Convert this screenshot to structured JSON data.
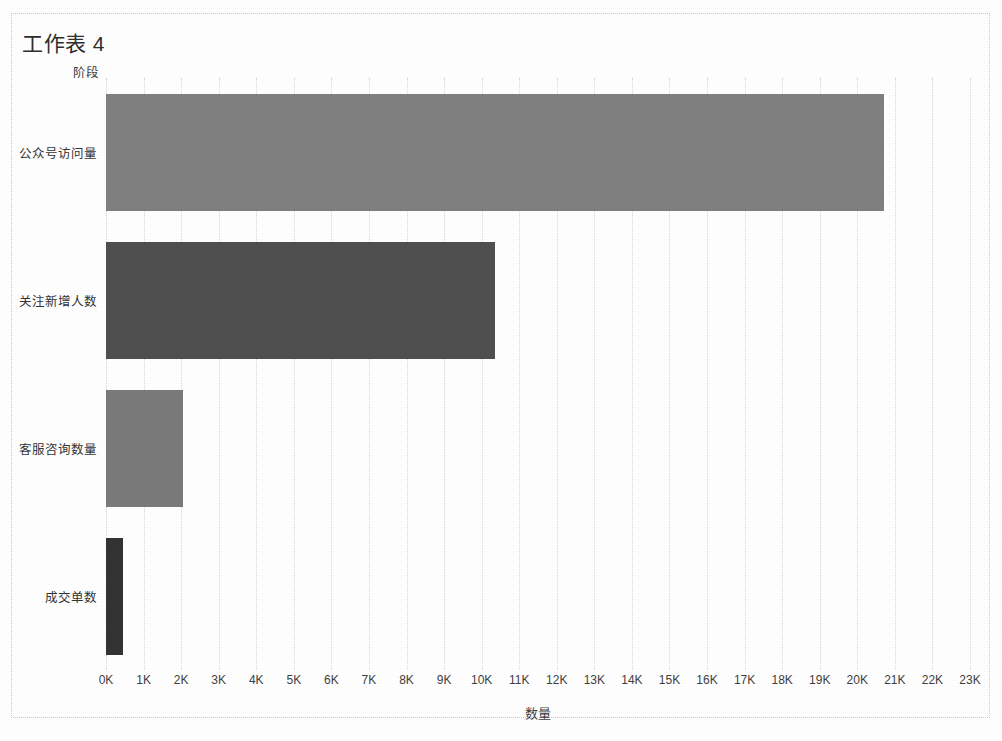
{
  "chart_title": "工作表 4",
  "axis_titles": {
    "y": "阶段",
    "x": "数量"
  },
  "ticks": {
    "x": [
      "0K",
      "1K",
      "2K",
      "3K",
      "4K",
      "5K",
      "6K",
      "7K",
      "8K",
      "9K",
      "10K",
      "11K",
      "12K",
      "13K",
      "14K",
      "15K",
      "16K",
      "17K",
      "18K",
      "19K",
      "20K",
      "21K",
      "22K",
      "23K"
    ]
  },
  "categories": [
    "公众号访问量",
    "关注新增人数",
    "客服咨询数量",
    "成交单数"
  ],
  "colors": {
    "bar_1": "#7f7f7f",
    "bar_2": "#4f4f4f",
    "bar_3": "#7a7a7a",
    "bar_4": "#333333",
    "gridline": "#d8d8d8",
    "frame": "#c9c9c9",
    "text": "#343434",
    "background": "#fefefe"
  },
  "chart_data": {
    "type": "bar",
    "orientation": "horizontal",
    "title": "工作表 4",
    "xlabel": "数量",
    "ylabel": "阶段",
    "categories": [
      "公众号访问量",
      "关注新增人数",
      "客服咨询数量",
      "成交单数"
    ],
    "values": [
      20700,
      10350,
      2050,
      450
    ],
    "xlim": [
      0,
      23000
    ],
    "xtick_labels": [
      "0K",
      "1K",
      "2K",
      "3K",
      "4K",
      "5K",
      "6K",
      "7K",
      "8K",
      "9K",
      "10K",
      "11K",
      "12K",
      "13K",
      "14K",
      "15K",
      "16K",
      "17K",
      "18K",
      "19K",
      "20K",
      "21K",
      "22K",
      "23K"
    ],
    "xtick_values": [
      0,
      1000,
      2000,
      3000,
      4000,
      5000,
      6000,
      7000,
      8000,
      9000,
      10000,
      11000,
      12000,
      13000,
      14000,
      15000,
      16000,
      17000,
      18000,
      19000,
      20000,
      21000,
      22000,
      23000
    ],
    "grid": true,
    "grid_axis": "x",
    "grid_style": "dotted",
    "legend": false,
    "bar_colors": [
      "#7f7f7f",
      "#4f4f4f",
      "#7a7a7a",
      "#333333"
    ],
    "series": [
      {
        "name": "数量",
        "values": [
          20700,
          10350,
          2050,
          450
        ]
      }
    ]
  }
}
